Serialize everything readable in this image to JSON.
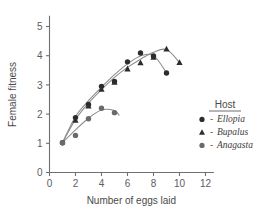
{
  "chart_data": {
    "type": "scatter",
    "title": "",
    "xlabel": "Number of eggs laid",
    "ylabel": "Female fitness",
    "xlim": [
      0,
      12.6
    ],
    "ylim": [
      0,
      5.35
    ],
    "xticks": [
      0,
      2,
      4,
      6,
      8,
      10,
      12
    ],
    "xticklabels": [
      "0",
      "2",
      "4",
      "6",
      "8",
      "10",
      "12"
    ],
    "yticks": [
      0,
      1,
      2,
      3,
      4,
      5
    ],
    "yticklabels": [
      "0",
      "1",
      "2",
      "3",
      "4",
      "5"
    ],
    "grid": false,
    "legend_position": "right-inside",
    "legend_title": "Host",
    "series": [
      {
        "name": "Ellopia",
        "marker": "circle",
        "color": "#2c2c2c",
        "points": [
          {
            "x": 1,
            "y": 1.02
          },
          {
            "x": 2,
            "y": 1.88
          },
          {
            "x": 3,
            "y": 2.33
          },
          {
            "x": 4,
            "y": 2.95
          },
          {
            "x": 5,
            "y": 3.12
          },
          {
            "x": 6,
            "y": 3.79
          },
          {
            "x": 7,
            "y": 4.09
          },
          {
            "x": 8,
            "y": 3.99
          },
          {
            "x": 9,
            "y": 3.41
          }
        ],
        "fit_curve": [
          {
            "x": 1,
            "y": 1.02
          },
          {
            "x": 2,
            "y": 1.92
          },
          {
            "x": 3,
            "y": 2.46
          },
          {
            "x": 4,
            "y": 2.92
          },
          {
            "x": 5,
            "y": 3.35
          },
          {
            "x": 6,
            "y": 3.72
          },
          {
            "x": 7,
            "y": 3.99
          },
          {
            "x": 8,
            "y": 4.01
          },
          {
            "x": 9,
            "y": 3.41
          }
        ]
      },
      {
        "name": "Bupalus",
        "marker": "triangle",
        "color": "#2c2c2c",
        "points": [
          {
            "x": 2,
            "y": 1.79
          },
          {
            "x": 3,
            "y": 2.28
          },
          {
            "x": 4,
            "y": 2.85
          },
          {
            "x": 5,
            "y": 3.09
          },
          {
            "x": 6,
            "y": 3.55
          },
          {
            "x": 7,
            "y": 3.76
          },
          {
            "x": 8,
            "y": 3.95
          },
          {
            "x": 9,
            "y": 4.23
          },
          {
            "x": 10,
            "y": 3.77
          }
        ],
        "fit_curve": [
          {
            "x": 1,
            "y": 1.02
          },
          {
            "x": 2,
            "y": 1.82
          },
          {
            "x": 3,
            "y": 2.38
          },
          {
            "x": 4,
            "y": 2.84
          },
          {
            "x": 5,
            "y": 3.26
          },
          {
            "x": 6,
            "y": 3.6
          },
          {
            "x": 7,
            "y": 3.88
          },
          {
            "x": 8,
            "y": 4.12
          },
          {
            "x": 9,
            "y": 4.21
          },
          {
            "x": 10,
            "y": 3.77
          }
        ]
      },
      {
        "name": "Anagasta",
        "marker": "circle",
        "color": "#6a6a6a",
        "points": [
          {
            "x": 1,
            "y": 1.02
          },
          {
            "x": 2,
            "y": 1.27
          },
          {
            "x": 3,
            "y": 1.84
          },
          {
            "x": 4,
            "y": 2.2
          },
          {
            "x": 5,
            "y": 2.05
          }
        ],
        "fit_curve": [
          {
            "x": 1,
            "y": 1.02
          },
          {
            "x": 2,
            "y": 1.46
          },
          {
            "x": 3,
            "y": 1.86
          },
          {
            "x": 4,
            "y": 2.14
          },
          {
            "x": 5,
            "y": 2.12
          },
          {
            "x": 5.35,
            "y": 1.96
          }
        ]
      }
    ]
  },
  "legend": {
    "title": "Host",
    "entries": [
      {
        "marker": "circle-dark",
        "dash": "-",
        "label": "Ellopia"
      },
      {
        "marker": "triangle-dark",
        "dash": "-",
        "label": "Bupalus"
      },
      {
        "marker": "circle-mid",
        "dash": "-",
        "label": "Anagasta"
      }
    ]
  },
  "colors": {
    "axis": "#6f6f6f",
    "curve": "#8e8e8e",
    "dark_marker": "#2c2c2c",
    "mid_marker": "#6a6a6a",
    "text": "#4a4a4a",
    "background": "#ffffff"
  }
}
